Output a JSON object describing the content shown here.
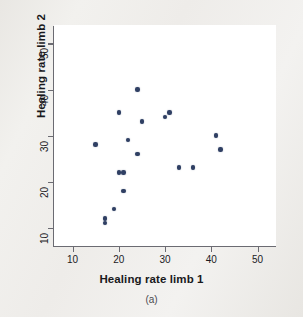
{
  "figure": {
    "caption": "(a)",
    "marker_color": "#2f3f63",
    "panel_background": "#ffffff",
    "axis_color": "#6b6b72"
  },
  "chart_data": {
    "type": "scatter",
    "title": "",
    "xlabel": "Healing rate limb 1",
    "ylabel": "Healing rate limb 2",
    "xlim": [
      6,
      54
    ],
    "ylim": [
      6,
      54
    ],
    "xticks": [
      10,
      20,
      30,
      40,
      50
    ],
    "yticks": [
      10,
      20,
      30,
      40,
      50
    ],
    "xtick_labels": [
      "10",
      "20",
      "30",
      "40",
      "50"
    ],
    "ytick_labels": [
      "10",
      "20",
      "30",
      "40",
      "50"
    ],
    "grid": false,
    "legend": false,
    "series": [
      {
        "name": "Healing rate pairs",
        "points": [
          [
            15,
            28
          ],
          [
            17,
            12
          ],
          [
            17,
            11
          ],
          [
            19,
            14
          ],
          [
            20,
            22
          ],
          [
            20,
            35
          ],
          [
            21,
            22
          ],
          [
            21,
            18
          ],
          [
            22,
            29
          ],
          [
            24,
            40
          ],
          [
            24,
            26
          ],
          [
            25,
            33
          ],
          [
            30,
            34
          ],
          [
            31,
            35
          ],
          [
            33,
            23
          ],
          [
            36,
            23
          ],
          [
            41,
            30
          ],
          [
            42,
            27
          ]
        ]
      }
    ],
    "n_points": 18
  }
}
